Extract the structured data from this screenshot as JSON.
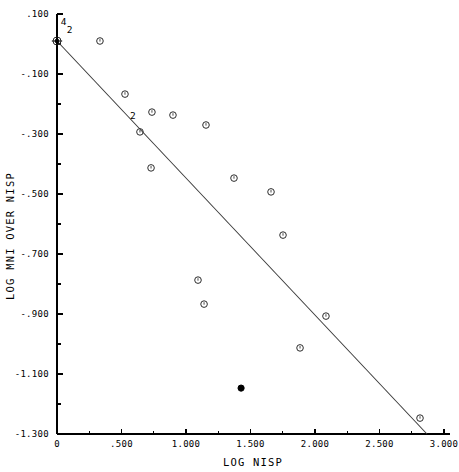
{
  "chart_data": {
    "type": "scatter",
    "title": "",
    "xlabel": "LOG NISP",
    "ylabel": "LOG MNI OVER NISP",
    "xlim": [
      0,
      3.0
    ],
    "ylim": [
      -1.3,
      0.1
    ],
    "grid": false,
    "legend": "none",
    "x_ticks_major": [
      "0",
      ".500",
      "1.000",
      "1.500",
      "2.000",
      "2.500",
      "3.000"
    ],
    "x_tick_values": [
      0,
      0.5,
      1.0,
      1.5,
      2.0,
      2.5,
      3.0
    ],
    "x_minor_tick_values": [
      0.25,
      0.75,
      1.25,
      1.75,
      2.25,
      2.75
    ],
    "y_ticks_major": [
      ".100",
      "-.100",
      "-.300",
      "-.500",
      "-.700",
      "-.900",
      "-1.100",
      "-1.300"
    ],
    "y_tick_values": [
      0.1,
      -0.1,
      -0.3,
      -0.5,
      -0.7,
      -0.9,
      -1.1,
      -1.3
    ],
    "y_minor_tick_values": [
      0.0,
      -0.2,
      -0.4,
      -0.6,
      -0.8,
      -1.0,
      -1.2
    ],
    "marker_open_symbol": "open-circle",
    "marker_filled_symbol": "filled-circle",
    "points": [
      {
        "x": 0.0,
        "y": 0.01,
        "marker": "overlap-cross",
        "count_labels": [
          "4",
          "2"
        ]
      },
      {
        "x": 0.333,
        "y": 0.01,
        "marker": "open-circle"
      },
      {
        "x": 0.527,
        "y": -0.167,
        "marker": "open-circle"
      },
      {
        "x": 0.736,
        "y": -0.227,
        "marker": "open-circle"
      },
      {
        "x": 0.899,
        "y": -0.237,
        "marker": "open-circle"
      },
      {
        "x": 0.643,
        "y": -0.293,
        "marker": "open-circle",
        "count_labels": [
          "2"
        ]
      },
      {
        "x": 1.155,
        "y": -0.27,
        "marker": "open-circle"
      },
      {
        "x": 0.729,
        "y": -0.413,
        "marker": "open-circle"
      },
      {
        "x": 1.372,
        "y": -0.447,
        "marker": "open-circle"
      },
      {
        "x": 1.659,
        "y": -0.493,
        "marker": "open-circle"
      },
      {
        "x": 1.752,
        "y": -0.637,
        "marker": "open-circle"
      },
      {
        "x": 1.093,
        "y": -0.787,
        "marker": "open-circle"
      },
      {
        "x": 1.14,
        "y": -0.867,
        "marker": "open-circle"
      },
      {
        "x": 2.085,
        "y": -0.907,
        "marker": "open-circle"
      },
      {
        "x": 1.884,
        "y": -1.013,
        "marker": "open-circle"
      },
      {
        "x": 1.427,
        "y": -1.147,
        "marker": "filled-circle"
      },
      {
        "x": 2.814,
        "y": -1.247,
        "marker": "open-circle"
      }
    ],
    "fit_line": {
      "x_start": 0.0,
      "y_start": 0.01,
      "x_end": 2.868,
      "y_end": -1.3,
      "style": "solid"
    },
    "annotations": [
      {
        "text": "4",
        "x": 0.03,
        "y": 0.063,
        "note": "overlap count at origin"
      },
      {
        "text": "2",
        "x": 0.075,
        "y": 0.037,
        "note": "overlap count at origin"
      },
      {
        "text": "2",
        "x": 0.565,
        "y": -0.25,
        "note": "overlap count mid-plot"
      }
    ]
  },
  "axis": {
    "x_title": "LOG NISP",
    "y_title": "LOG MNI OVER NISP"
  }
}
